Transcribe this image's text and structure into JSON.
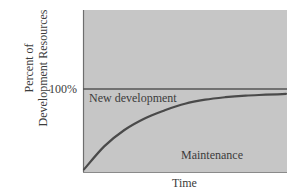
{
  "chart_data": {
    "type": "area",
    "title": "",
    "xlabel": "Time",
    "ylabel": "Percent of Development Resources",
    "ylabel_lines": [
      "Percent of",
      "Development Resources"
    ],
    "y_ticks": [
      {
        "label": "100%",
        "value": 100
      }
    ],
    "x_ticks": [],
    "ylim": [
      0,
      100
    ],
    "grid": false,
    "legend": null,
    "reference_line": {
      "y": 100,
      "label": "100%"
    },
    "series": [
      {
        "name": "Maintenance",
        "description": "Share of resources spent on maintenance, rising over time and approaching 100%",
        "x": [
          0,
          0.1,
          0.2,
          0.3,
          0.4,
          0.5,
          0.6,
          0.7,
          0.8,
          0.9,
          1.0
        ],
        "values": [
          2,
          30,
          50,
          64,
          74,
          82,
          87,
          90,
          92,
          93,
          94
        ]
      }
    ],
    "regions": [
      {
        "name": "New development",
        "position": "above curve"
      },
      {
        "name": "Maintenance",
        "position": "below curve"
      }
    ],
    "annotations": [
      "New development",
      "Maintenance"
    ]
  },
  "labels": {
    "y_tick_100": "100%",
    "region_new_development": "New development",
    "region_maintenance": "Maintenance",
    "x_axis": "Time",
    "y_axis_line1": "Percent of",
    "y_axis_line2": "Development Resources"
  },
  "colors": {
    "plot_background": "#c6c6c6",
    "axis_line": "#6e6e6e",
    "reference_line": "#555555",
    "curve": "#4a4a4a",
    "text": "#3c3c3c"
  }
}
